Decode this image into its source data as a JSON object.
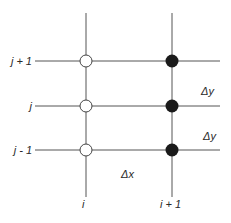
{
  "diagram": {
    "type": "finite-difference grid stencil",
    "row_labels": [
      "j + 1",
      "j",
      "j - 1"
    ],
    "column_labels": [
      "i",
      "i + 1"
    ],
    "spacing_labels": {
      "dy_upper": "Δy",
      "dy_lower": "Δy",
      "dx": "Δx"
    },
    "nodes": [
      {
        "col": "i",
        "row": "j + 1",
        "style": "open"
      },
      {
        "col": "i",
        "row": "j",
        "style": "open"
      },
      {
        "col": "i",
        "row": "j - 1",
        "style": "open"
      },
      {
        "col": "i + 1",
        "row": "j + 1",
        "style": "filled"
      },
      {
        "col": "i + 1",
        "row": "j",
        "style": "filled"
      },
      {
        "col": "i + 1",
        "row": "j - 1",
        "style": "filled"
      }
    ],
    "colors": {
      "line": "#555555",
      "filled_node": "#1a1a1a",
      "open_node_fill": "#ffffff",
      "text": "#2a2a2a"
    }
  }
}
